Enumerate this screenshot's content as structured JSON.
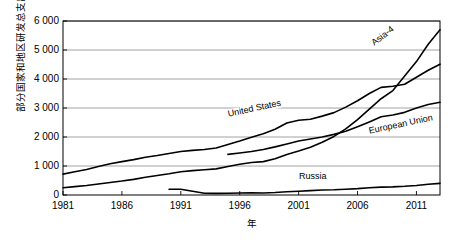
{
  "chart_data": {
    "type": "line",
    "title": "",
    "xlabel": "年",
    "ylabel": "部分国家和地区研发总支出/亿美元",
    "xlim": [
      1981,
      2013
    ],
    "ylim": [
      0,
      6000
    ],
    "grid": true,
    "legend_position": "inline-labels",
    "x_ticks": [
      "1981",
      "1986",
      "1991",
      "1996",
      "2001",
      "2006",
      "2011"
    ],
    "x_tick_values": [
      1981,
      1986,
      1991,
      1996,
      2001,
      2006,
      2011
    ],
    "y_ticks": [
      "0",
      "1 000",
      "2 000",
      "3 000",
      "4 000",
      "5 000",
      "6 000"
    ],
    "y_tick_values": [
      0,
      1000,
      2000,
      3000,
      4000,
      5000,
      6000
    ],
    "series": [
      {
        "name": "United States",
        "label": "United States",
        "color": "#000000",
        "x": [
          1981,
          1982,
          1983,
          1984,
          1985,
          1986,
          1987,
          1988,
          1989,
          1990,
          1991,
          1992,
          1993,
          1994,
          1995,
          1996,
          1997,
          1998,
          1999,
          2000,
          2001,
          2002,
          2003,
          2004,
          2005,
          2006,
          2007,
          2008,
          2009,
          2010,
          2011,
          2012,
          2013
        ],
        "y": [
          720,
          800,
          880,
          980,
          1080,
          1150,
          1220,
          1300,
          1360,
          1430,
          1500,
          1540,
          1570,
          1620,
          1740,
          1860,
          1990,
          2110,
          2270,
          2480,
          2580,
          2610,
          2720,
          2840,
          3030,
          3250,
          3500,
          3710,
          3750,
          3820,
          4060,
          4300,
          4510
        ]
      },
      {
        "name": "Asia-4",
        "label": "Asia-4",
        "color": "#000000",
        "x": [
          1981,
          1982,
          1983,
          1984,
          1985,
          1986,
          1987,
          1988,
          1989,
          1990,
          1991,
          1992,
          1993,
          1994,
          1995,
          1996,
          1997,
          1998,
          1999,
          2000,
          2001,
          2002,
          2003,
          2004,
          2005,
          2006,
          2007,
          2008,
          2009,
          2010,
          2011,
          2012,
          2013
        ],
        "y": [
          250,
          290,
          330,
          380,
          430,
          480,
          540,
          610,
          670,
          730,
          800,
          840,
          870,
          900,
          980,
          1060,
          1120,
          1150,
          1250,
          1400,
          1520,
          1650,
          1820,
          2020,
          2280,
          2600,
          2960,
          3320,
          3600,
          4100,
          4600,
          5200,
          5700
        ]
      },
      {
        "name": "European Union",
        "label": "European Union",
        "color": "#000000",
        "x": [
          1995,
          1996,
          1997,
          1998,
          1999,
          2000,
          2001,
          2002,
          2003,
          2004,
          2005,
          2006,
          2007,
          2008,
          2009,
          2010,
          2011,
          2012,
          2013
        ],
        "y": [
          1400,
          1450,
          1500,
          1570,
          1660,
          1760,
          1860,
          1930,
          2000,
          2090,
          2200,
          2350,
          2520,
          2700,
          2760,
          2850,
          3000,
          3120,
          3200
        ]
      },
      {
        "name": "Russia",
        "label": "Russia",
        "color": "#000000",
        "x": [
          1990,
          1991,
          1992,
          1993,
          1994,
          1995,
          1996,
          1997,
          1998,
          1999,
          2000,
          2001,
          2002,
          2003,
          2004,
          2005,
          2006,
          2007,
          2008,
          2009,
          2010,
          2011,
          2012,
          2013
        ],
        "y": [
          200,
          200,
          130,
          60,
          55,
          60,
          70,
          75,
          70,
          85,
          110,
          130,
          150,
          170,
          180,
          200,
          220,
          250,
          270,
          280,
          300,
          330,
          370,
          400
        ]
      }
    ]
  }
}
